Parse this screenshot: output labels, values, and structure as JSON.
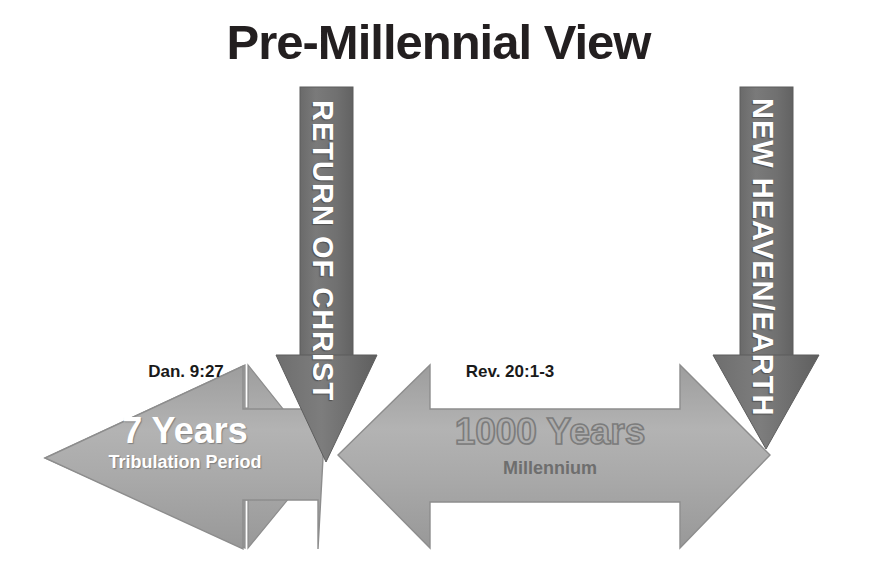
{
  "page": {
    "title": "Pre-Millennial View",
    "background_color": "#ffffff"
  },
  "colors": {
    "title_text": "#231f20",
    "arrow_light_gray": "#a8a8a8",
    "arrow_dark_gray": "#6f6f6f",
    "arrow_outline": "#8a8a8a",
    "white_text": "#ffffff",
    "ref_text": "#1a1a1a",
    "millennium_text": "#6e6e6e",
    "thousand_years_fill": "#adadad",
    "thousand_years_stroke": "#7c7c7c"
  },
  "diagram": {
    "type": "timeline-arrows",
    "horizontal_arrows": [
      {
        "id": "tribulation-arrow",
        "reference": "Dan. 9:27",
        "main_label": "7 Years",
        "sub_label": "Tribulation Period",
        "direction": "double-headed",
        "fill": "#a8a8a8",
        "label_style": "white-solid"
      },
      {
        "id": "millennium-arrow",
        "reference": "Rev. 20:1-3",
        "main_label": "1000 Years",
        "sub_label": "Millennium",
        "direction": "double-headed",
        "fill": "#a8a8a8",
        "label_style": "gray-outlined"
      }
    ],
    "vertical_arrows": [
      {
        "id": "return-of-christ-arrow",
        "label": "RETURN OF CHRIST",
        "direction": "down",
        "fill": "#6f6f6f",
        "orientation": "rotated-90-clockwise"
      },
      {
        "id": "new-heaven-earth-arrow",
        "label": "NEW HEAVEN/EARTH",
        "direction": "down",
        "fill": "#6f6f6f",
        "orientation": "rotated-90-clockwise"
      }
    ]
  }
}
